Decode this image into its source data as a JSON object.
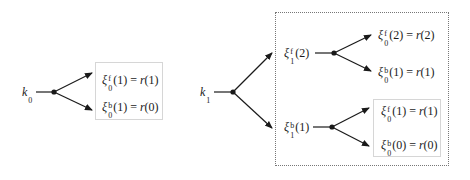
{
  "diagram": {
    "left_tree": {
      "root": {
        "symbol": "k",
        "sub": "0"
      },
      "leaves": [
        {
          "sym": "ξ",
          "sup": "f",
          "sub": "0",
          "arg": "(1)",
          "eq": " = ",
          "rhs_fn": "r",
          "rhs_arg": "(1)"
        },
        {
          "sym": "ξ",
          "sup": "b",
          "sub": "0",
          "arg": "(1)",
          "eq": " = ",
          "rhs_fn": "r",
          "rhs_arg": "(0)"
        }
      ]
    },
    "right_tree": {
      "root": {
        "symbol": "k",
        "sub": "1"
      },
      "children": [
        {
          "node": {
            "sym": "ξ",
            "sup": "f",
            "sub": "1",
            "arg": "(2)"
          },
          "leaves": [
            {
              "sym": "ξ",
              "sup": "f",
              "sub": "0",
              "arg": "(2)",
              "eq": " = ",
              "rhs_fn": "r",
              "rhs_arg": "(2)"
            },
            {
              "sym": "ξ",
              "sup": "b",
              "sub": "0",
              "arg": "(1)",
              "eq": " = ",
              "rhs_fn": "r",
              "rhs_arg": "(1)"
            }
          ]
        },
        {
          "node": {
            "sym": "ξ",
            "sup": "b",
            "sub": "1",
            "arg": "(1)"
          },
          "leaves": [
            {
              "sym": "ξ",
              "sup": "f",
              "sub": "0",
              "arg": "(1)",
              "eq": " = ",
              "rhs_fn": "r",
              "rhs_arg": "(1)"
            },
            {
              "sym": "ξ",
              "sup": "b",
              "sub": "0",
              "arg": "(0)",
              "eq": " = ",
              "rhs_fn": "r",
              "rhs_arg": "(0)"
            }
          ]
        }
      ]
    },
    "colors": {
      "line": "#1a1a1a",
      "solid_box": "#d6d6d6",
      "dotted_box": "#777777"
    }
  }
}
